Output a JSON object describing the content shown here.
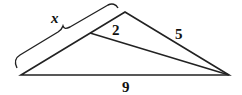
{
  "diagram": {
    "type": "triangle-with-cevian",
    "labels": {
      "x": "x",
      "segment_top": "2",
      "right_side": "5",
      "base": "9"
    },
    "colors": {
      "stroke": "#222222",
      "background": "#ffffff"
    }
  }
}
